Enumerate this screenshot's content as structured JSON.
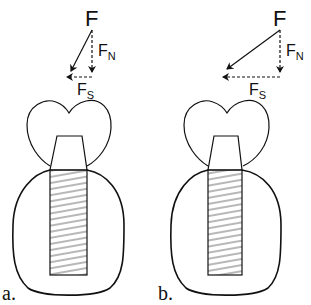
{
  "figure": {
    "panels": [
      {
        "id": "a",
        "label": "a.",
        "force": {
          "main": "F",
          "normal": "F",
          "normal_sub": "N",
          "shear": "F",
          "shear_sub": "S"
        },
        "description": "Implant with near-vertical oblique load; small shear component"
      },
      {
        "id": "b",
        "label": "b.",
        "force": {
          "main": "F",
          "normal": "F",
          "normal_sub": "N",
          "shear": "F",
          "shear_sub": "S"
        },
        "description": "Implant with more oblique load; larger shear component"
      }
    ],
    "colors": {
      "stroke": "#111111",
      "background": "#ffffff"
    }
  }
}
